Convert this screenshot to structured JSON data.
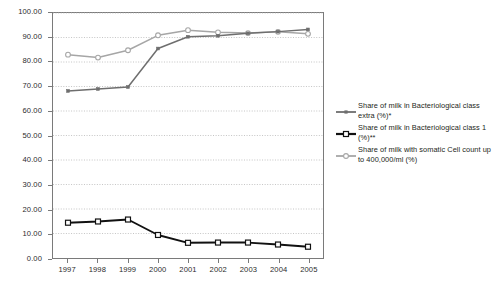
{
  "chart_data": {
    "type": "line",
    "title": "",
    "xlabel": "",
    "ylabel": "",
    "categories": [
      "1997",
      "1998",
      "1999",
      "2000",
      "2001",
      "2002",
      "2003",
      "2004",
      "2005"
    ],
    "ylim": [
      0,
      100
    ],
    "ytick_step": 10,
    "ytick_labels": [
      "0.00",
      "10.00",
      "20.00",
      "30.00",
      "40.00",
      "50.00",
      "60.00",
      "70.00",
      "80.00",
      "90.00",
      "100.00"
    ],
    "ytick_values": [
      0,
      10,
      20,
      30,
      40,
      50,
      60,
      70,
      80,
      90,
      100
    ],
    "grid": true,
    "grid_style": "dotted-horizontal",
    "legend_position": "right",
    "series": [
      {
        "name": "Share of milk in Bacteriological class extra (%)*",
        "key": "extra",
        "color": "#6e6e6e",
        "marker": "small-filled-square",
        "values": [
          68.2,
          69.0,
          69.8,
          85.5,
          90.3,
          90.7,
          91.7,
          92.4,
          93.3
        ]
      },
      {
        "name": "Share of milk in Bacteriological class 1 (%)**",
        "key": "class1",
        "color": "#111111",
        "marker": "open-square",
        "values": [
          14.4,
          14.9,
          15.7,
          9.4,
          6.2,
          6.3,
          6.3,
          5.5,
          4.6
        ]
      },
      {
        "name": "Share of milk with somatic Cell count up to 400,000/ml (%)",
        "key": "somatic",
        "color": "#a6a6a6",
        "marker": "open-circle",
        "values": [
          83.0,
          81.8,
          84.8,
          90.9,
          93.0,
          92.1,
          91.8,
          92.3,
          91.5
        ]
      }
    ]
  },
  "legend": {
    "entries": [
      {
        "label": "Share of milk in Bacteriological class extra (%)*"
      },
      {
        "label": "Share of milk in Bacteriological class 1 (%)**"
      },
      {
        "label": "Share of milk with somatic Cell count up to 400,000/ml (%)"
      }
    ]
  },
  "colors": {
    "series_extra": "#6e6e6e",
    "series_class1": "#111111",
    "series_somatic": "#a6a6a6",
    "axis": "#7a7a7a",
    "grid": "#b5b5b5",
    "text": "#231f20",
    "background": "#ffffff"
  }
}
